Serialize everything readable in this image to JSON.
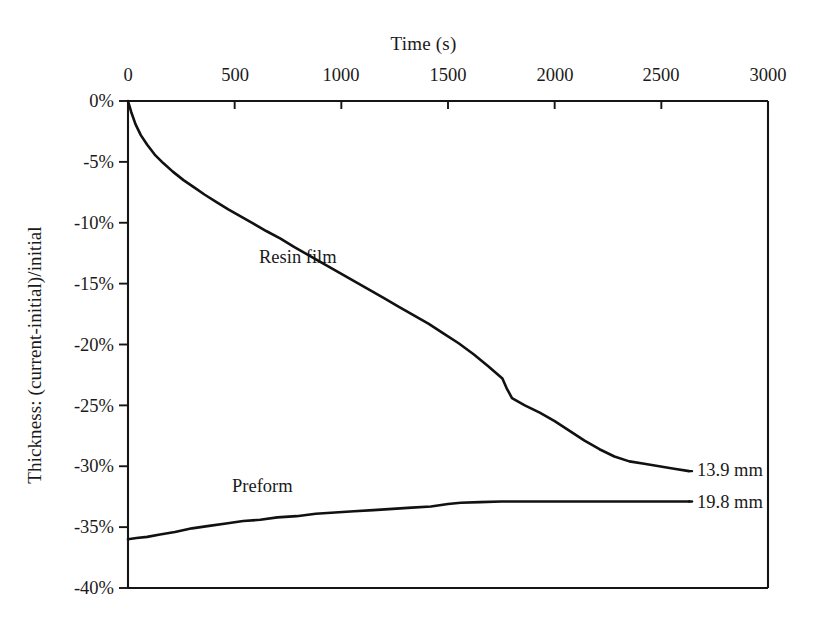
{
  "chart_data": {
    "type": "line",
    "title": "",
    "xlabel": "Time (s)",
    "ylabel": "Thickness: (current-initial)/initial",
    "xlim": [
      0,
      3000
    ],
    "ylim": [
      -40,
      0
    ],
    "grid": false,
    "legend_position": "inline-annotations",
    "xticks": [
      0,
      500,
      1000,
      1500,
      2000,
      2500,
      3000
    ],
    "xtick_labels": [
      "0",
      "500",
      "1000",
      "1500",
      "2000",
      "2500",
      "3000"
    ],
    "yticks": [
      0,
      -5,
      -10,
      -15,
      -20,
      -25,
      -30,
      -35,
      -40
    ],
    "ytick_labels": [
      "0%",
      "-5%",
      "-10%",
      "-15%",
      "-20%",
      "-25%",
      "-30%",
      "-35%",
      "-40%"
    ],
    "series": [
      {
        "name": "Resin film",
        "end_label": "13.9 mm",
        "color": "#111111",
        "x": [
          0,
          15,
          35,
          60,
          90,
          125,
          165,
          210,
          260,
          310,
          360,
          415,
          470,
          530,
          590,
          650,
          715,
          780,
          850,
          920,
          990,
          1060,
          1130,
          1200,
          1270,
          1340,
          1410,
          1480,
          1550,
          1620,
          1690,
          1755,
          1775,
          1800,
          1860,
          1930,
          2000,
          2070,
          2140,
          2210,
          2280,
          2350,
          2420,
          2490,
          2560,
          2630
        ],
        "y": [
          0.0,
          -0.9,
          -1.9,
          -2.8,
          -3.6,
          -4.4,
          -5.1,
          -5.8,
          -6.5,
          -7.1,
          -7.7,
          -8.3,
          -8.9,
          -9.5,
          -10.1,
          -10.7,
          -11.3,
          -12.0,
          -12.7,
          -13.4,
          -14.1,
          -14.8,
          -15.5,
          -16.2,
          -16.9,
          -17.6,
          -18.3,
          -19.1,
          -19.9,
          -20.8,
          -21.8,
          -22.8,
          -23.6,
          -24.4,
          -25.0,
          -25.6,
          -26.3,
          -27.1,
          -27.9,
          -28.6,
          -29.2,
          -29.6,
          -29.8,
          -30.0,
          -30.2,
          -30.4
        ]
      },
      {
        "name": "Preform",
        "end_label": "19.8 mm",
        "color": "#111111",
        "x": [
          0,
          40,
          90,
          150,
          220,
          300,
          380,
          460,
          540,
          620,
          700,
          790,
          880,
          970,
          1060,
          1150,
          1240,
          1330,
          1420,
          1500,
          1560,
          1650,
          1750,
          1860,
          1980,
          2100,
          2220,
          2340,
          2460,
          2560,
          2630
        ],
        "y": [
          -36.0,
          -35.9,
          -35.8,
          -35.6,
          -35.4,
          -35.1,
          -34.9,
          -34.7,
          -34.5,
          -34.4,
          -34.2,
          -34.1,
          -33.9,
          -33.8,
          -33.7,
          -33.6,
          -33.5,
          -33.4,
          -33.3,
          -33.1,
          -33.0,
          -32.95,
          -32.9,
          -32.9,
          -32.9,
          -32.9,
          -32.9,
          -32.9,
          -32.9,
          -32.9,
          -32.9
        ]
      }
    ],
    "annotations": [
      {
        "text": "Resin film",
        "x": 1250,
        "y": -12.8
      },
      {
        "text": "Preform",
        "x": 960,
        "y": -30.6
      }
    ]
  },
  "axes": {
    "x_title": "Time (s)",
    "y_title": "Thickness: (current-initial)/initial"
  },
  "labels": {
    "resin_film": "Resin film",
    "preform": "Preform",
    "resin_end": "13.9 mm",
    "preform_end": "19.8 mm"
  },
  "xticks": [
    "0",
    "500",
    "1000",
    "1500",
    "2000",
    "2500",
    "3000"
  ],
  "yticks": [
    "0%",
    "-5%",
    "-10%",
    "-15%",
    "-20%",
    "-25%",
    "-30%",
    "-35%",
    "-40%"
  ]
}
